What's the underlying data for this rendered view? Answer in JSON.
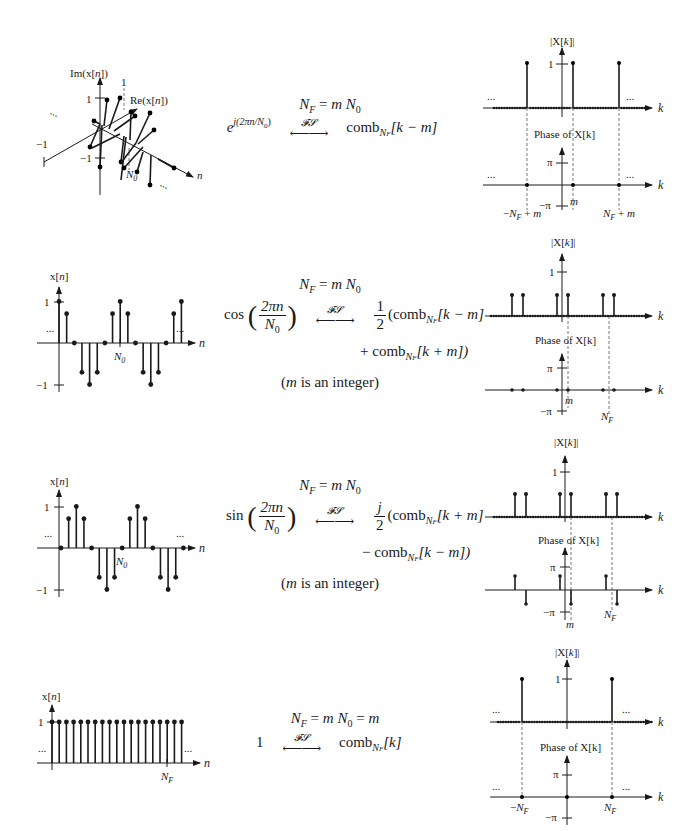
{
  "rows": [
    {
      "id": "complex-exponential",
      "time_plot": {
        "ylabel": "Im(x[n])",
        "re_label": "Re(x[n])",
        "xlabel": "n",
        "tick_pos": "1",
        "tick_neg": "−1",
        "re_tick_pos": "1",
        "re_tick_neg": "−1",
        "period_label": "N₀",
        "ellipsis": "..."
      },
      "formula": {
        "relation": "N_F = m N_0",
        "lhs": "e^{j(2πn/N_0)}",
        "operator": "FS",
        "rhs": "comb_{N_F}[k − m]"
      },
      "spectrum": {
        "mag_label": "|X[k]|",
        "mag_tick": "1",
        "phase_label": "Phase of X[k]",
        "phase_tick_pos": "π",
        "phase_tick_neg": "−π",
        "xlabel": "k",
        "marker_labels": [
          "−N_F + m",
          "m",
          "N_F + m"
        ],
        "ellipsis": "..."
      }
    },
    {
      "id": "cosine",
      "time_plot": {
        "ylabel": "x[n]",
        "xlabel": "n",
        "tick_pos": "1",
        "tick_neg": "−1",
        "period_label": "N₀",
        "ellipsis": "..."
      },
      "formula": {
        "relation": "N_F = m N_0",
        "lhs": "cos(2πn / N_0)",
        "operator": "FS",
        "rhs_line1": "1/2 (comb_{N_F}[k − m]",
        "rhs_line2": "+ comb_{N_F}[k + m])",
        "note": "(m is an integer)"
      },
      "spectrum": {
        "mag_label": "|X[k]|",
        "mag_tick": "1",
        "phase_label": "Phase of X[k]",
        "phase_tick_pos": "π",
        "phase_tick_neg": "−π",
        "xlabel": "k",
        "marker_labels": [
          "m",
          "N_F"
        ]
      }
    },
    {
      "id": "sine",
      "time_plot": {
        "ylabel": "x[n]",
        "xlabel": "n",
        "tick_pos": "1",
        "tick_neg": "−1",
        "period_label": "N₀",
        "ellipsis": "..."
      },
      "formula": {
        "relation": "N_F = m N_0",
        "lhs": "sin(2πn / N_0)",
        "operator": "FS",
        "rhs_line1": "j/2 (comb_{N_F}[k + m]",
        "rhs_line2": "− comb_{N_F}[k − m])",
        "note": "(m is an integer)"
      },
      "spectrum": {
        "mag_label": "|X[k]|",
        "mag_tick": "1",
        "phase_label": "Phase of X[k]",
        "phase_tick_pos": "π",
        "phase_tick_neg": "−π",
        "xlabel": "k",
        "marker_labels": [
          "m",
          "N_F"
        ]
      }
    },
    {
      "id": "constant",
      "time_plot": {
        "ylabel": "x[n]",
        "xlabel": "n",
        "tick_pos": "1",
        "period_label": "N_F",
        "ellipsis": "..."
      },
      "formula": {
        "relation": "N_F = m N_0 = m",
        "lhs": "1",
        "operator": "FS",
        "rhs": "comb_{N_F}[k]"
      },
      "spectrum": {
        "mag_label": "|X[k]|",
        "mag_tick": "1",
        "phase_label": "Phase of X[k]",
        "phase_tick_pos": "π",
        "phase_tick_neg": "−π",
        "xlabel": "k",
        "marker_labels": [
          "−N_F",
          "N_F"
        ],
        "ellipsis": "..."
      }
    }
  ],
  "text": {
    "fs": "𝓕𝓢",
    "n": "n",
    "k": "k",
    "m": "m",
    "NF": "N",
    "F": "F",
    "N0": "N",
    "zero": "0",
    "eq": " = ",
    "mN0": "m",
    "comb": "comb",
    "k_minus_m": "[k − m]",
    "k_plus_m": "[k + m]",
    "k_bracket": "[k]",
    "k_plus_m_close": "[k + m])",
    "k_minus_m_close": "[k − m])",
    "plus": "+ ",
    "minus": "− ",
    "one": "1",
    "two": "2",
    "j": "j",
    "twopin": "2πn",
    "cos": "cos",
    "sin": "sin",
    "e": "e",
    "exp_sup": "j(2πn/N",
    "exp_sub0": "0",
    "exp_close": ")",
    "open_comb": "(comb",
    "note_m": "m",
    "note_rest": " is an integer)",
    "note_open": "(",
    "eq_m": " = m"
  }
}
